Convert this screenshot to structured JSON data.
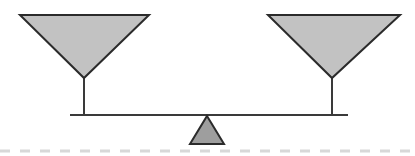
{
  "figure": {
    "canvas": {
      "width": 415,
      "height": 156,
      "background": "#ffffff"
    }
  },
  "colors": {
    "pan_fill": "#c2c2c2",
    "pan_stroke": "#2b2b2b",
    "fulcrum_fill": "#9e9e9e",
    "fulcrum_stroke": "#2b2b2b",
    "beam": "#3a3a3a",
    "stem": "#3a3a3a",
    "ground_dash": "#d8d8d8"
  },
  "parts": {
    "left_pan": {
      "name": "left pan",
      "shape": "inverted-triangle",
      "points": "20,15 149,15 84,78",
      "stroke_width": 2
    },
    "right_pan": {
      "name": "right pan",
      "shape": "inverted-triangle",
      "points": "268,15 400,15 332,78",
      "stroke_width": 2
    },
    "left_stem": {
      "name": "left pan stem",
      "x": 84,
      "y1": 76,
      "y2": 116,
      "stroke_width": 2
    },
    "right_stem": {
      "name": "right pan stem",
      "x": 332,
      "y1": 76,
      "y2": 116,
      "stroke_width": 2
    },
    "beam": {
      "name": "balance beam",
      "x1": 70,
      "x2": 348,
      "y": 115,
      "stroke_width": 2
    },
    "fulcrum": {
      "name": "fulcrum",
      "shape": "triangle",
      "points": "207,116 224,144 190,144",
      "stroke_width": 2
    },
    "ground": {
      "name": "dashed ground line",
      "x1": 0,
      "x2": 415,
      "y": 151,
      "stroke_width": 3,
      "dash_pattern": "10 10"
    }
  }
}
